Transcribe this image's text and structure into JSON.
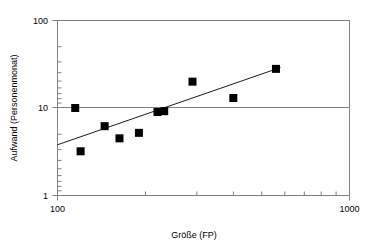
{
  "chart_data": {
    "type": "scatter",
    "title": "",
    "xlabel": "Größe (FP)",
    "ylabel": "Aufwand (Personenmonat)",
    "xscale": "log",
    "yscale": "log",
    "xlim": [
      100,
      1000
    ],
    "ylim": [
      1,
      100
    ],
    "x_tick_labels": [
      "100",
      "1000"
    ],
    "y_tick_labels": [
      "100",
      "10",
      "1"
    ],
    "x_ticks": [
      100,
      1000
    ],
    "y_ticks": [
      1,
      10,
      100
    ],
    "grid": "horizontal-major-only",
    "legend": "none",
    "x": [
      115,
      120,
      145,
      163,
      190,
      220,
      232,
      290,
      400,
      560
    ],
    "y": [
      10,
      3.2,
      6.2,
      4.5,
      5.2,
      9.0,
      9.2,
      20,
      13,
      28
    ],
    "points": [
      {
        "x": 115,
        "y": 10.0
      },
      {
        "x": 120,
        "y": 3.2
      },
      {
        "x": 145,
        "y": 6.2
      },
      {
        "x": 163,
        "y": 4.5
      },
      {
        "x": 190,
        "y": 5.2
      },
      {
        "x": 220,
        "y": 9.0
      },
      {
        "x": 232,
        "y": 9.2
      },
      {
        "x": 290,
        "y": 20.0
      },
      {
        "x": 400,
        "y": 13.0
      },
      {
        "x": 560,
        "y": 28.0
      }
    ],
    "series": [
      {
        "name": "Projekte",
        "marker": "square",
        "color": "#000000",
        "values": [
          10.0,
          3.2,
          6.2,
          4.5,
          5.2,
          9.0,
          9.2,
          20.0,
          13.0,
          28.0
        ]
      },
      {
        "name": "Trendlinie",
        "type": "line",
        "color": "#1a1a1a",
        "endpoints": [
          {
            "x": 100,
            "y": 3.8
          },
          {
            "x": 580,
            "y": 29.0
          }
        ]
      }
    ],
    "trendline": {
      "x_start": 100,
      "y_start": 3.8,
      "x_end": 580,
      "y_end": 29.0
    },
    "colors": {
      "marker": "#000000",
      "trendline": "#1a1a1a",
      "axis": "#808080",
      "text": "#000000",
      "background": "#ffffff"
    }
  },
  "axes": {
    "y_label_top": "100",
    "y_label_mid": "10",
    "y_label_bottom": "1",
    "x_label_left": "100",
    "x_label_right": "1000",
    "x_title": "Größe (FP)",
    "y_title": "Aufwand (Personenmonat)"
  }
}
